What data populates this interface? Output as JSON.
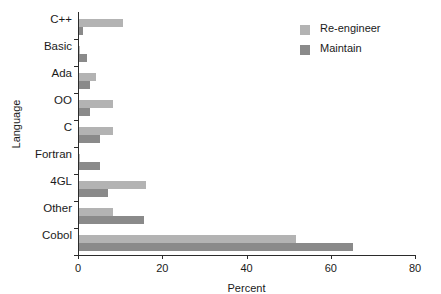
{
  "chart_data": {
    "type": "bar",
    "orientation": "horizontal",
    "title": "",
    "xlabel": "Percent",
    "ylabel": "Language",
    "xlim": [
      0,
      80
    ],
    "xticks": [
      0,
      20,
      40,
      60,
      80
    ],
    "grid": false,
    "legend_position": "top-right",
    "categories": [
      "C++",
      "Basic",
      "Ada",
      "OO",
      "C",
      "Fortran",
      "4GL",
      "Other",
      "Cobol"
    ],
    "series": [
      {
        "name": "Re-engineer",
        "color": "#b3b3b3",
        "values": [
          10.5,
          0.3,
          4,
          8,
          8,
          0.3,
          16,
          8,
          51.5
        ]
      },
      {
        "name": "Maintain",
        "color": "#8a8a8a",
        "values": [
          1,
          2,
          2.5,
          2.5,
          5,
          5,
          7,
          15.5,
          65
        ]
      }
    ]
  },
  "axis": {
    "x_title": "Percent",
    "y_title": "Language",
    "x_tick_labels": [
      "0",
      "20",
      "40",
      "60",
      "80"
    ]
  },
  "legend": {
    "items": [
      {
        "label": "Re-engineer",
        "color": "#b3b3b3"
      },
      {
        "label": "Maintain",
        "color": "#8a8a8a"
      }
    ]
  }
}
